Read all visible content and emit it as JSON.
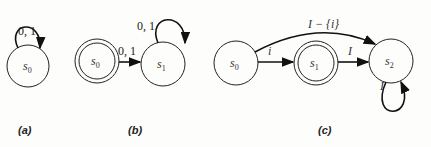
{
  "diagrams": [
    {
      "caption": "(a)",
      "states": [
        {
          "id": "s0",
          "label": "s",
          "sub": "0",
          "accepting": false
        }
      ],
      "transitions": [
        {
          "from": "s0",
          "to": "s0",
          "label": "0, 1"
        }
      ]
    },
    {
      "caption": "(b)",
      "states": [
        {
          "id": "s0",
          "label": "s",
          "sub": "0",
          "accepting": true
        },
        {
          "id": "s1",
          "label": "s",
          "sub": "1",
          "accepting": false
        }
      ],
      "transitions": [
        {
          "from": "s0",
          "to": "s1",
          "label": "0, 1"
        },
        {
          "from": "s1",
          "to": "s1",
          "label": "0, 1"
        }
      ]
    },
    {
      "caption": "(c)",
      "states": [
        {
          "id": "s0",
          "label": "s",
          "sub": "0",
          "accepting": false
        },
        {
          "id": "s1",
          "label": "s",
          "sub": "1",
          "accepting": true
        },
        {
          "id": "s2",
          "label": "s",
          "sub": "2",
          "accepting": false
        }
      ],
      "transitions": [
        {
          "from": "s0",
          "to": "s1",
          "label": "i"
        },
        {
          "from": "s1",
          "to": "s2",
          "label": "I"
        },
        {
          "from": "s0",
          "to": "s2",
          "label": "I − {i}"
        },
        {
          "from": "s2",
          "to": "s2",
          "label": "I"
        }
      ]
    }
  ]
}
